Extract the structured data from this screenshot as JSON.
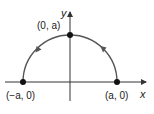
{
  "figure": {
    "type": "semicircle-parametric-path",
    "axes": {
      "x_label": "x",
      "y_label": "y"
    },
    "points": [
      {
        "id": "right",
        "label": "(a, 0)",
        "math": {
          "x": "a",
          "y": "0"
        }
      },
      {
        "id": "top",
        "label": "(0, a)",
        "math": {
          "x": "0",
          "y": "a"
        }
      },
      {
        "id": "left",
        "label": "(−a, 0)",
        "math": {
          "x": "-a",
          "y": "0"
        }
      }
    ],
    "direction": "counterclockwise",
    "colors": {
      "axes": "#333333",
      "curve": "#555555",
      "points": "#111111",
      "text": "#222222"
    }
  }
}
